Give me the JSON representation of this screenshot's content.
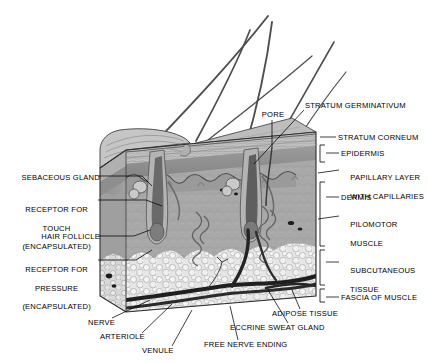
{
  "figure": {
    "style": "grayscale anatomical illustration, 3D cut-away block",
    "background_color": "#ffffff",
    "line_color": "#000000",
    "palette": {
      "stratum_corneum": "#b9b9b9",
      "epidermis": "#8f8f8f",
      "dermis": "#a8a8a8",
      "papillary_layer": "#9a9a9a",
      "subcutaneous_fat": "#e2e2e2",
      "vessel_dark": "#2a2a2a",
      "hair_shaft": "#4a4a4a",
      "block_side_face": "#9c9c9c"
    }
  },
  "labels": {
    "left": [
      {
        "id": "sebaceous-gland",
        "text": "SEBACEOUS GLAND",
        "lines": [
          "SEBACEOUS GLAND"
        ],
        "x": 12,
        "y": 178,
        "align": "left",
        "leader_to": [
          140,
          186
        ]
      },
      {
        "id": "receptor-touch",
        "text": "RECEPTOR FOR TOUCH (ENCAPSULATED)",
        "lines": [
          "RECEPTOR FOR",
          "TOUCH",
          "(ENCAPSULATED)"
        ],
        "x": 12,
        "y": 200,
        "align": "left",
        "leader_to": [
          150,
          205
        ]
      },
      {
        "id": "hair-follicle",
        "text": "HAIR FOLLICLE",
        "lines": [
          "HAIR FOLLICLE"
        ],
        "x": 12,
        "y": 238,
        "align": "left",
        "leader_to": [
          138,
          232
        ]
      },
      {
        "id": "receptor-pressure",
        "text": "RECEPTOR FOR PRESSURE (ENCAPSULATED)",
        "lines": [
          "RECEPTOR FOR",
          "PRESSURE",
          "(ENCAPSULATED)"
        ],
        "x": 12,
        "y": 258,
        "align": "left",
        "leader_to": [
          148,
          252
        ]
      }
    ],
    "top": [
      {
        "id": "pore",
        "text": "PORE",
        "lines": [
          "PORE"
        ],
        "x": 262,
        "y": 113,
        "align": "left",
        "leader_to": [
          272,
          147
        ]
      },
      {
        "id": "stratum-germinativum",
        "text": "STRATUM GERMINATIVUM",
        "lines": [
          "STRATUM GERMINATIVUM"
        ],
        "x": 305,
        "y": 104,
        "align": "left",
        "leader_to": [
          253,
          163
        ]
      }
    ],
    "right": [
      {
        "id": "stratum-corneum",
        "text": "STRATUM CORNEUM",
        "lines": [
          "STRATUM CORNEUM"
        ],
        "x": 338,
        "y": 137,
        "align": "left",
        "leader_to": [
          318,
          140
        ]
      },
      {
        "id": "epidermis",
        "text": "EPIDERMIS",
        "lines": [
          "EPIDERMIS"
        ],
        "x": 341,
        "y": 153,
        "align": "left",
        "bracket": true
      },
      {
        "id": "papillary-layer",
        "text": "PAPILLARY LAYER WITH CAPILLARIES",
        "lines": [
          "PAPILLARY LAYER",
          "WITH CAPILLARIES"
        ],
        "x": 341,
        "y": 168,
        "align": "left",
        "leader_to": [
          318,
          172
        ]
      },
      {
        "id": "dermis",
        "text": "DERMIS",
        "lines": [
          "DERMIS"
        ],
        "x": 341,
        "y": 196,
        "align": "left",
        "bracket": true
      },
      {
        "id": "pilomotor-muscle",
        "text": "PILOMOTOR MUSCLE",
        "lines": [
          "PILOMOTOR",
          "MUSCLE"
        ],
        "x": 341,
        "y": 214,
        "align": "left",
        "leader_to": [
          318,
          218
        ]
      },
      {
        "id": "subcutaneous-tissue",
        "text": "SUBCUTANEOUS TISSUE",
        "lines": [
          "SUBCUTANEOUS",
          "TISSUE"
        ],
        "x": 341,
        "y": 259,
        "align": "left",
        "bracket": true
      },
      {
        "id": "fascia-of-muscle",
        "text": "FASCIA OF MUSCLE",
        "lines": [
          "FASCIA OF MUSCLE"
        ],
        "x": 341,
        "y": 296,
        "align": "left",
        "bracket": true
      }
    ],
    "bottom": [
      {
        "id": "nerve",
        "text": "NERVE",
        "lines": [
          "NERVE"
        ],
        "x": 88,
        "y": 322,
        "align": "left",
        "leader_to": [
          148,
          300
        ]
      },
      {
        "id": "arteriole",
        "text": "ARTERIOLE",
        "lines": [
          "ARTERIOLE"
        ],
        "x": 100,
        "y": 337,
        "align": "left",
        "leader_to": [
          168,
          305
        ]
      },
      {
        "id": "venule",
        "text": "VENULE",
        "lines": [
          "VENULE"
        ],
        "x": 142,
        "y": 351,
        "align": "left",
        "leader_to": [
          186,
          310
        ]
      },
      {
        "id": "free-nerve-ending",
        "text": "FREE NERVE ENDING",
        "lines": [
          "FREE NERVE ENDING"
        ],
        "x": 206,
        "y": 344,
        "align": "left",
        "leader_to": [
          228,
          306
        ]
      },
      {
        "id": "eccrine-sweat-gland",
        "text": "ECCRINE SWEAT GLAND",
        "lines": [
          "ECCRINE SWEAT GLAND"
        ],
        "x": 232,
        "y": 327,
        "align": "left",
        "leader_to": [
          262,
          288
        ]
      },
      {
        "id": "adipose-tissue",
        "text": "ADIPOSE TISSUE",
        "lines": [
          "ADIPOSE TISSUE"
        ],
        "x": 272,
        "y": 313,
        "align": "left",
        "leader_to": [
          290,
          288
        ]
      }
    ]
  },
  "structures": [
    {
      "name": "hair-shaft",
      "count": 5,
      "description": "long hair shafts sweeping up and to the right from the skin surface"
    },
    {
      "name": "hair-follicle",
      "count": 2,
      "description": "deep bulb-shaped follicles penetrating the dermis"
    },
    {
      "name": "sebaceous-gland",
      "count": 2,
      "description": "lobed glands attached to the follicle"
    },
    {
      "name": "eccrine-sweat-gland",
      "count": 2,
      "description": "coiled tubular glands at the dermis/subcutaneous border"
    },
    {
      "name": "blood-vessel",
      "count": 4,
      "description": "dark arteriole and venule running through the subcutaneous fat"
    },
    {
      "name": "epidermis-flap",
      "count": 1,
      "description": "peeled-back corner of epidermis at the upper left"
    }
  ]
}
